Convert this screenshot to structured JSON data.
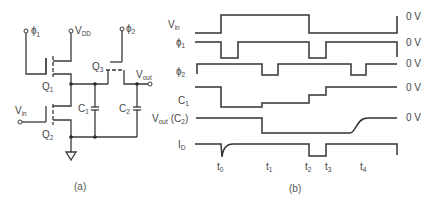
{
  "figure_a": {
    "caption": "(a)",
    "labels": {
      "phi1": "ϕ",
      "phi1_sub": "1",
      "vdd": "V",
      "vdd_sub": "DD",
      "phi2": "ϕ",
      "phi2_sub": "2",
      "q1": "Q",
      "q1_sub": "1",
      "q2": "Q",
      "q2_sub": "2",
      "q3": "Q",
      "q3_sub": "3",
      "vin": "V",
      "vin_sub": "in",
      "vout": "V",
      "vout_sub": "out",
      "c1": "C",
      "c1_sub": "1",
      "c2": "C",
      "c2_sub": "2"
    }
  },
  "figure_b": {
    "caption": "(b)",
    "signals": [
      {
        "name": "V",
        "sub": "in",
        "suffix": "",
        "ref": "0 V"
      },
      {
        "name": "ϕ",
        "sub": "1",
        "suffix": "",
        "ref": "0 V"
      },
      {
        "name": "ϕ",
        "sub": "2",
        "suffix": "",
        "ref": "0 V"
      },
      {
        "name": "C",
        "sub": "1",
        "suffix": "",
        "ref": "0 V"
      },
      {
        "name": "V",
        "sub": "out",
        "suffix": "(C",
        "suffix_sub": "2",
        "suffix_end": ")",
        "ref": "0 V"
      },
      {
        "name": "I",
        "sub": "D",
        "suffix": "",
        "ref": ""
      }
    ],
    "time_markers": [
      {
        "label": "t",
        "sub": "0"
      },
      {
        "label": "t",
        "sub": "1"
      },
      {
        "label": "t",
        "sub": "2"
      },
      {
        "label": "t",
        "sub": "3"
      },
      {
        "label": "t",
        "sub": "4"
      }
    ]
  }
}
